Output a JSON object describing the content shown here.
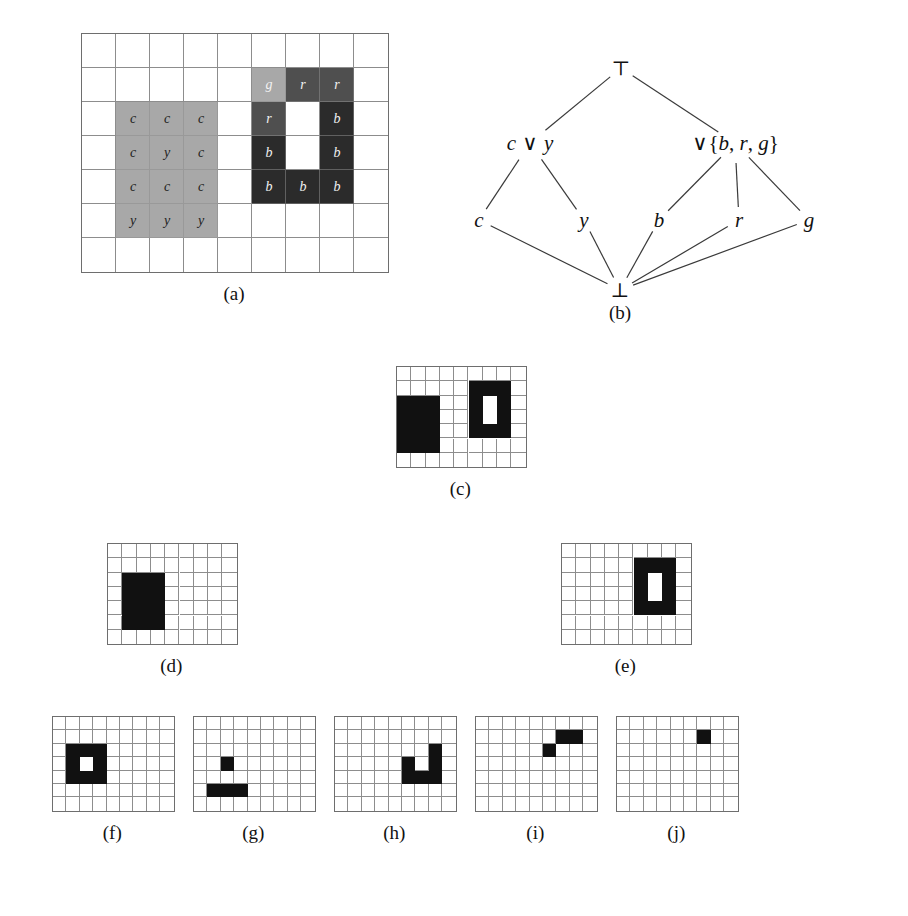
{
  "figure": {
    "kind": "multi-panel-diagram",
    "panels": [
      {
        "id": "a",
        "caption": "(a)"
      },
      {
        "id": "b",
        "caption": "(b)"
      },
      {
        "id": "c",
        "caption": "(c)"
      },
      {
        "id": "d",
        "caption": "(d)"
      },
      {
        "id": "e",
        "caption": "(e)"
      },
      {
        "id": "f",
        "caption": "(f)"
      },
      {
        "id": "g",
        "caption": "(g)"
      },
      {
        "id": "h",
        "caption": "(h)"
      },
      {
        "id": "i",
        "caption": "(i)"
      },
      {
        "id": "j",
        "caption": "(j)"
      }
    ]
  },
  "palette": {
    "black": "#111111",
    "dark_gray": "#2b2b2b",
    "mid_gray": "#4f4f4f",
    "light_gray": "#a8a8a8",
    "white": "#ffffff",
    "grid_line": "#8d8d8d",
    "grid_border": "#6e6e6e"
  },
  "panel_a": {
    "caption": "(a)",
    "grid": {
      "cols": 9,
      "rows": 7,
      "cell": 34,
      "origin_x": 81,
      "origin_y": 33
    },
    "regions": [
      {
        "name": "cyan-region",
        "shade": "light",
        "col": 1,
        "row": 2,
        "w": 3,
        "h": 4
      },
      {
        "name": "green-cell",
        "shade": "light",
        "col": 5,
        "row": 1,
        "w": 1,
        "h": 1
      },
      {
        "name": "red-cells",
        "shade": "mid",
        "col": 6,
        "row": 1,
        "w": 2,
        "h": 1
      },
      {
        "name": "red-cell-left",
        "shade": "mid",
        "col": 5,
        "row": 2,
        "w": 1,
        "h": 1
      },
      {
        "name": "blue-ring-right",
        "shade": "dark",
        "col": 7,
        "row": 2,
        "w": 1,
        "h": 2
      },
      {
        "name": "blue-ring-left",
        "shade": "dark",
        "col": 5,
        "row": 3,
        "w": 1,
        "h": 1
      },
      {
        "name": "blue-ring-bottom",
        "shade": "dark",
        "col": 5,
        "row": 4,
        "w": 3,
        "h": 1
      }
    ],
    "labels": [
      {
        "text": "c",
        "col": 1,
        "row": 2,
        "on": "light"
      },
      {
        "text": "c",
        "col": 2,
        "row": 2,
        "on": "light"
      },
      {
        "text": "c",
        "col": 3,
        "row": 2,
        "on": "light"
      },
      {
        "text": "c",
        "col": 1,
        "row": 3,
        "on": "light"
      },
      {
        "text": "y",
        "col": 2,
        "row": 3,
        "on": "light"
      },
      {
        "text": "c",
        "col": 3,
        "row": 3,
        "on": "light"
      },
      {
        "text": "c",
        "col": 1,
        "row": 4,
        "on": "light"
      },
      {
        "text": "c",
        "col": 2,
        "row": 4,
        "on": "light"
      },
      {
        "text": "c",
        "col": 3,
        "row": 4,
        "on": "light"
      },
      {
        "text": "y",
        "col": 1,
        "row": 5,
        "on": "light"
      },
      {
        "text": "y",
        "col": 2,
        "row": 5,
        "on": "light"
      },
      {
        "text": "y",
        "col": 3,
        "row": 5,
        "on": "light"
      },
      {
        "text": "g",
        "col": 5,
        "row": 1,
        "on": "dark"
      },
      {
        "text": "r",
        "col": 6,
        "row": 1,
        "on": "dark"
      },
      {
        "text": "r",
        "col": 7,
        "row": 1,
        "on": "dark"
      },
      {
        "text": "r",
        "col": 5,
        "row": 2,
        "on": "dark"
      },
      {
        "text": "b",
        "col": 7,
        "row": 2,
        "on": "dark"
      },
      {
        "text": "b",
        "col": 5,
        "row": 3,
        "on": "dark"
      },
      {
        "text": "b",
        "col": 7,
        "row": 3,
        "on": "dark"
      },
      {
        "text": "b",
        "col": 5,
        "row": 4,
        "on": "dark"
      },
      {
        "text": "b",
        "col": 6,
        "row": 4,
        "on": "dark"
      },
      {
        "text": "b",
        "col": 7,
        "row": 4,
        "on": "dark"
      }
    ]
  },
  "panel_b": {
    "caption": "(b)",
    "type": "hasse-diagram",
    "nodes": [
      {
        "id": "top",
        "label": "⊤",
        "x": 191,
        "y": 23,
        "style": "sym"
      },
      {
        "id": "cvy",
        "label": "c ∨ y",
        "x": 100,
        "y": 98,
        "style": "mixed"
      },
      {
        "id": "vbrg",
        "label": "∨{b, r, g}",
        "x": 305,
        "y": 98,
        "style": "mixed"
      },
      {
        "id": "c",
        "label": "c",
        "x": 49,
        "y": 175,
        "style": "italic"
      },
      {
        "id": "y",
        "label": "y",
        "x": 154,
        "y": 175,
        "style": "italic"
      },
      {
        "id": "b",
        "label": "b",
        "x": 229,
        "y": 175,
        "style": "italic"
      },
      {
        "id": "r",
        "label": "r",
        "x": 309,
        "y": 175,
        "style": "italic"
      },
      {
        "id": "g",
        "label": "g",
        "x": 379,
        "y": 175,
        "style": "italic"
      },
      {
        "id": "bottom",
        "label": "⊥",
        "x": 190,
        "y": 245,
        "style": "sym"
      }
    ],
    "edges": [
      {
        "from": "top",
        "to": "cvy"
      },
      {
        "from": "top",
        "to": "vbrg"
      },
      {
        "from": "cvy",
        "to": "c"
      },
      {
        "from": "cvy",
        "to": "y"
      },
      {
        "from": "vbrg",
        "to": "b"
      },
      {
        "from": "vbrg",
        "to": "r"
      },
      {
        "from": "vbrg",
        "to": "g"
      },
      {
        "from": "c",
        "to": "bottom"
      },
      {
        "from": "y",
        "to": "bottom"
      },
      {
        "from": "b",
        "to": "bottom"
      },
      {
        "from": "r",
        "to": "bottom"
      },
      {
        "from": "g",
        "to": "bottom"
      }
    ]
  },
  "panel_c": {
    "caption": "(c)",
    "grid": {
      "cols": 9,
      "rows": 7,
      "cell": 14.3,
      "origin_x": 396,
      "origin_y": 366
    },
    "fills": [
      {
        "shade": "black",
        "col": 0,
        "row": 2,
        "w": 3,
        "h": 4
      },
      {
        "shade": "black",
        "col": 5,
        "row": 1,
        "w": 3,
        "h": 4
      },
      {
        "shade": "white",
        "col": 6,
        "row": 2,
        "w": 1,
        "h": 2
      }
    ]
  },
  "panel_d": {
    "caption": "(d)",
    "grid": {
      "cols": 9,
      "rows": 7,
      "cell": 14.3,
      "origin_x": 107,
      "origin_y": 543
    },
    "fills": [
      {
        "shade": "black",
        "col": 1,
        "row": 2,
        "w": 3,
        "h": 4
      }
    ]
  },
  "panel_e": {
    "caption": "(e)",
    "grid": {
      "cols": 9,
      "rows": 7,
      "cell": 14.3,
      "origin_x": 561,
      "origin_y": 543
    },
    "fills": [
      {
        "shade": "black",
        "col": 5,
        "row": 1,
        "w": 3,
        "h": 4
      },
      {
        "shade": "white",
        "col": 6,
        "row": 2,
        "w": 1,
        "h": 2
      }
    ]
  },
  "panel_f": {
    "caption": "(f)",
    "grid": {
      "cols": 9,
      "rows": 7,
      "cell": 13.4,
      "origin_x": 52,
      "origin_y": 716
    },
    "fills": [
      {
        "shade": "black",
        "col": 1,
        "row": 2,
        "w": 3,
        "h": 3
      },
      {
        "shade": "white",
        "col": 2,
        "row": 3,
        "w": 1,
        "h": 1
      }
    ]
  },
  "panel_g": {
    "caption": "(g)",
    "grid": {
      "cols": 9,
      "rows": 7,
      "cell": 13.4,
      "origin_x": 193,
      "origin_y": 716
    },
    "fills": [
      {
        "shade": "black",
        "col": 2,
        "row": 3,
        "w": 1,
        "h": 1
      },
      {
        "shade": "black",
        "col": 1,
        "row": 5,
        "w": 3,
        "h": 1
      }
    ]
  },
  "panel_h": {
    "caption": "(h)",
    "grid": {
      "cols": 9,
      "rows": 7,
      "cell": 13.4,
      "origin_x": 334,
      "origin_y": 716
    },
    "fills": [
      {
        "shade": "black",
        "col": 7,
        "row": 2,
        "w": 1,
        "h": 3
      },
      {
        "shade": "black",
        "col": 5,
        "row": 3,
        "w": 1,
        "h": 2
      },
      {
        "shade": "black",
        "col": 6,
        "row": 4,
        "w": 1,
        "h": 1
      }
    ]
  },
  "panel_i": {
    "caption": "(i)",
    "grid": {
      "cols": 9,
      "rows": 7,
      "cell": 13.4,
      "origin_x": 475,
      "origin_y": 716
    },
    "fills": [
      {
        "shade": "black",
        "col": 6,
        "row": 1,
        "w": 2,
        "h": 1
      },
      {
        "shade": "black",
        "col": 5,
        "row": 2,
        "w": 1,
        "h": 1
      }
    ]
  },
  "panel_j": {
    "caption": "(j)",
    "grid": {
      "cols": 9,
      "rows": 7,
      "cell": 13.4,
      "origin_x": 616,
      "origin_y": 716
    },
    "fills": [
      {
        "shade": "black",
        "col": 6,
        "row": 1,
        "w": 1,
        "h": 1
      }
    ]
  }
}
